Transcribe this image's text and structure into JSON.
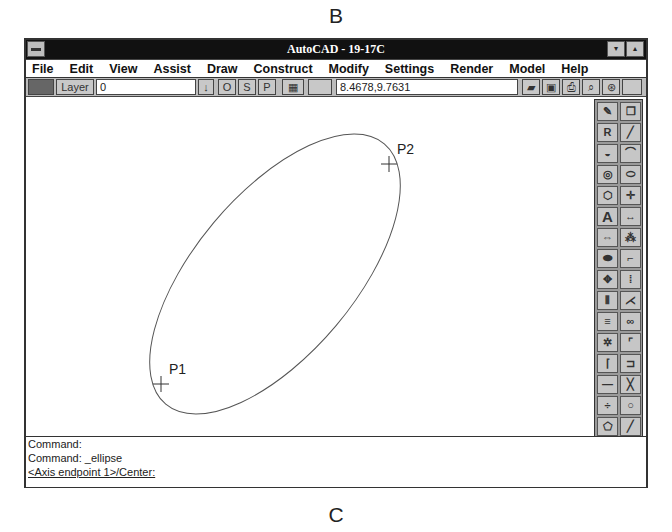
{
  "figure_labels": {
    "top": "B",
    "bottom": "C"
  },
  "window": {
    "title": "AutoCAD - 19-17C",
    "controls": {
      "minimize": "▾",
      "maximize": "▴"
    }
  },
  "menubar": {
    "items": [
      {
        "label": "File"
      },
      {
        "label": "Edit"
      },
      {
        "label": "View"
      },
      {
        "label": "Assist"
      },
      {
        "label": "Draw"
      },
      {
        "label": "Construct"
      },
      {
        "label": "Modify"
      },
      {
        "label": "Settings"
      },
      {
        "label": "Render"
      },
      {
        "label": "Model"
      },
      {
        "label": "Help"
      }
    ]
  },
  "toolbar": {
    "layer_button": "Layer",
    "layer_value": "0",
    "dropdown_arrow": "↓",
    "ortho": "O",
    "snap": "S",
    "paper": "P",
    "coordinates": "8.4678,9.7631",
    "tools": [
      "open",
      "save",
      "print",
      "zoom-window",
      "regen"
    ]
  },
  "drawing": {
    "points": [
      {
        "label": "P1",
        "x": 135,
        "y": 287
      },
      {
        "label": "P2",
        "x": 363,
        "y": 67
      }
    ],
    "ellipse": {
      "cx": 249,
      "cy": 177,
      "rx": 170,
      "ry": 80,
      "rotation": -50
    }
  },
  "icon_panel": {
    "icons": [
      "pencil",
      "copy-window",
      "R",
      "line",
      "donut",
      "arc",
      "circle",
      "ellipse",
      "polygon",
      "point",
      "A",
      "dimension",
      "stretch",
      "hatch",
      "erase",
      "fillet",
      "move",
      "array",
      "mirror",
      "scale",
      "align",
      "break",
      "explode",
      "chamfer",
      "extend",
      "trim",
      "offset",
      "cross",
      "divide",
      "circle-2",
      "polygon-2",
      "line-2",
      "insert",
      "block",
      "^C",
      "redo"
    ],
    "labels": {
      "R": "R",
      "A": "A",
      "^C": "^C"
    }
  },
  "command_area": {
    "lines": [
      "Command:",
      "Command: _ellipse",
      "<Axis endpoint 1>/Center:"
    ]
  }
}
